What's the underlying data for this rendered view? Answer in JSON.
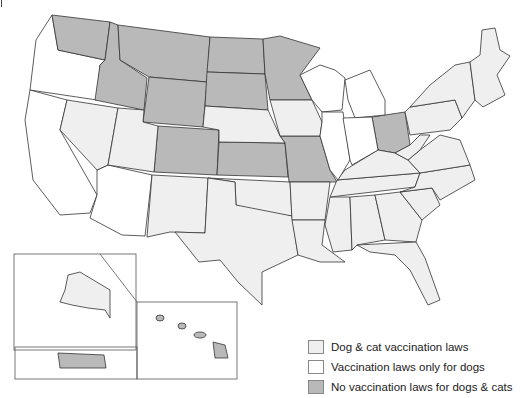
{
  "colors": {
    "dog_cat": "#efefef",
    "dogs_only": "#ffffff",
    "none": "#b9b9b9",
    "border": "#333333"
  },
  "legend": [
    {
      "key": "dog_cat",
      "label": "Dog & cat vaccination laws"
    },
    {
      "key": "dogs_only",
      "label": "Vaccination laws only for dogs"
    },
    {
      "key": "none",
      "label": "No vaccination laws for dogs & cats"
    }
  ]
}
